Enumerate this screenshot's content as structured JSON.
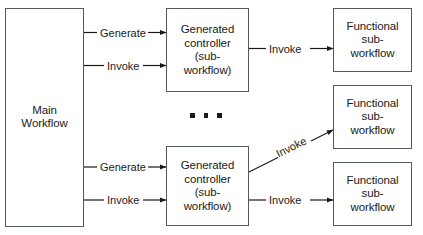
{
  "diagram": {
    "colors": {
      "background": "#ffffff",
      "box_stroke": "#555a5e",
      "arrow_stroke": "#1a1a1a",
      "text": "#1a1a1a"
    },
    "nodes": [
      {
        "id": "main-workflow",
        "label": "Main\nWorkflow"
      },
      {
        "id": "generated-controller-top",
        "label": "Generated\ncontroller\n(sub-\nworkflow)"
      },
      {
        "id": "generated-controller-bottom",
        "label": "Generated\ncontroller\n(sub-\nworkflow)"
      },
      {
        "id": "functional-subworkflow-top",
        "label": "Functional\nsub-\nworkflow"
      },
      {
        "id": "functional-subworkflow-middle",
        "label": "Functional\nsub-\nworkflow"
      },
      {
        "id": "functional-subworkflow-bottom",
        "label": "Functional\nsub-\nworkflow"
      }
    ],
    "edges": [
      {
        "id": "main-to-controller-top-generate",
        "label": "Generate",
        "from": "main-workflow",
        "to": "generated-controller-top"
      },
      {
        "id": "main-to-controller-top-invoke",
        "label": "Invoke",
        "from": "main-workflow",
        "to": "generated-controller-top"
      },
      {
        "id": "main-to-controller-bottom-generate",
        "label": "Generate",
        "from": "main-workflow",
        "to": "generated-controller-bottom"
      },
      {
        "id": "main-to-controller-bottom-invoke",
        "label": "Invoke",
        "from": "main-workflow",
        "to": "generated-controller-bottom"
      },
      {
        "id": "controller-top-to-functional-top",
        "label": "Invoke",
        "from": "generated-controller-top",
        "to": "functional-subworkflow-top"
      },
      {
        "id": "controller-bottom-to-functional-middle",
        "label": "Invoke",
        "from": "generated-controller-bottom",
        "to": "functional-subworkflow-middle"
      },
      {
        "id": "controller-bottom-to-functional-bottom",
        "label": "Invoke",
        "from": "generated-controller-bottom",
        "to": "functional-subworkflow-bottom"
      }
    ],
    "ellipsis": {
      "id": "vertical-ellipsis",
      "dots": 3
    }
  }
}
